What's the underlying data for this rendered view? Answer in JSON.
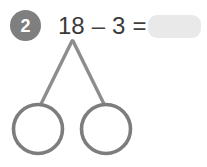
{
  "problem": {
    "number": "2",
    "equation": {
      "left_operand": "18",
      "operator": "–",
      "right_operand": "3",
      "equals": "=",
      "answer_value": "",
      "answer_placeholder": ""
    }
  },
  "number_bond": {
    "whole_value": "",
    "parts": [
      {
        "value": ""
      },
      {
        "value": ""
      }
    ]
  },
  "colors": {
    "badge_fill": "#7f7f7f",
    "badge_text": "#ffffff",
    "equation_text": "#3a3a3a",
    "answer_blank_fill": "#e9e9e9",
    "branch_stroke": "#8d8d8d",
    "circle_stroke": "#7d7d7d",
    "background": "#ffffff"
  }
}
